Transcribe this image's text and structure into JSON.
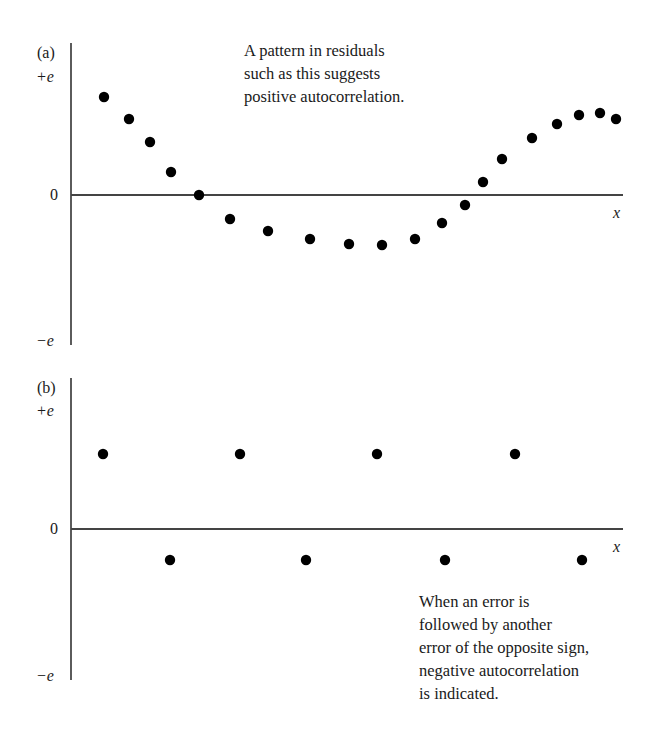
{
  "chart_data": [
    {
      "type": "scatter",
      "panel": "(a)",
      "title": "",
      "xlabel": "x",
      "ylabel": "residual e",
      "ytick_labels": [
        "+e",
        "0",
        "−e"
      ],
      "ylim": [
        -1,
        1
      ],
      "grid": false,
      "annotation": [
        "A pattern in residuals",
        "such as this suggests",
        "positive autocorrelation."
      ],
      "x": [
        1,
        2,
        3,
        4,
        5,
        6,
        7,
        8,
        9,
        10,
        11,
        12,
        13,
        14,
        15,
        16,
        17,
        18,
        19,
        20
      ],
      "values": [
        0.65,
        0.5,
        0.35,
        0.15,
        0.0,
        -0.16,
        -0.24,
        -0.29,
        -0.32,
        -0.33,
        -0.29,
        -0.18,
        -0.07,
        0.09,
        0.24,
        0.38,
        0.47,
        0.53,
        0.54,
        0.5
      ],
      "px": [
        [
          104,
          97
        ],
        [
          129,
          119
        ],
        [
          150,
          142
        ],
        [
          171,
          172
        ],
        [
          199,
          195
        ],
        [
          230,
          219
        ],
        [
          268,
          231
        ],
        [
          310,
          239
        ],
        [
          349,
          244
        ],
        [
          382,
          245
        ],
        [
          415,
          239
        ],
        [
          442,
          223
        ],
        [
          465,
          205
        ],
        [
          483,
          182
        ],
        [
          502,
          159
        ],
        [
          532,
          138
        ],
        [
          557,
          124
        ],
        [
          579,
          115
        ],
        [
          600,
          113
        ],
        [
          616,
          119
        ]
      ]
    },
    {
      "type": "scatter",
      "panel": "(b)",
      "title": "",
      "xlabel": "x",
      "ylabel": "residual e",
      "ytick_labels": [
        "+e",
        "0",
        "−e"
      ],
      "ylim": [
        -1,
        1
      ],
      "grid": false,
      "annotation": [
        "When an error is",
        "followed by another",
        "error of the opposite sign,",
        "negative autocorrelation",
        "is indicated."
      ],
      "x": [
        1,
        2,
        3,
        4,
        5,
        6,
        7,
        8
      ],
      "values": [
        0.5,
        -0.2,
        0.5,
        -0.2,
        0.5,
        -0.2,
        0.5,
        -0.2
      ],
      "px": [
        [
          103,
          454
        ],
        [
          170,
          560
        ],
        [
          240,
          454
        ],
        [
          306,
          560
        ],
        [
          377,
          454
        ],
        [
          445,
          560
        ],
        [
          515,
          454
        ],
        [
          582,
          560
        ]
      ]
    }
  ],
  "panel_a": {
    "label": "(a)",
    "plus_e": "+e",
    "zero": "0",
    "minus_e": "−e",
    "x_label": "x",
    "note": [
      "A pattern in residuals",
      "such as this suggests",
      "positive autocorrelation."
    ]
  },
  "panel_b": {
    "label": "(b)",
    "plus_e": "+e",
    "zero": "0",
    "minus_e": "−e",
    "x_label": "x",
    "note": [
      "When an error is",
      "followed by another",
      "error of the opposite sign,",
      "negative autocorrelation",
      "is indicated."
    ]
  }
}
